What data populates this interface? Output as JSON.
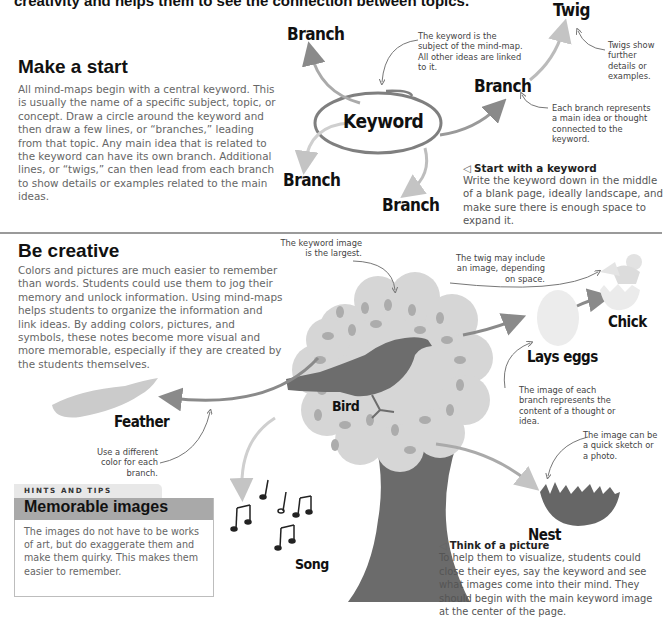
{
  "intro_line": "creativity and helps them to see the connection between topics.",
  "section1": {
    "heading": "Make a start",
    "body": "All mind-maps begin with a central keyword. This is usually the name of a specific subject, topic, or concept. Draw a circle around the keyword and then draw a few lines, or “branches,” leading from that topic. Any main idea that is related to the keyword can have its own branch. Additional lines, or “twigs,” can then lead from each branch to show details or examples related to the main ideas.",
    "diagram": {
      "keyword": "Keyword",
      "branch_top_left": "Branch",
      "branch_right": "Branch",
      "branch_bottom_left": "Branch",
      "branch_bottom": "Branch",
      "twig": "Twig",
      "note_keyword": "The keyword is the subject of the mind-map. All other ideas are linked to it.",
      "note_twigs": "Twigs show further details or examples.",
      "note_branch": "Each branch represents a main idea or thought connected to the keyword."
    },
    "caption": {
      "icon": "◁",
      "title": "Start with a keyword",
      "body": "Write the keyword down in the middle of a blank page, ideally landscape, and make sure there is enough space to expand it."
    }
  },
  "section2": {
    "heading": "Be creative",
    "body": "Colors and pictures are much easier to remember than words. Students could use them to jog their memory and unlock information. Using mind-maps helps students to organize the information and link ideas. By adding colors, pictures, and symbols, these notes become more visual and more memorable, especially if they are created by the students themselves.",
    "diagram": {
      "keyword": "Bird",
      "feather": "Feather",
      "song": "Song",
      "lays_eggs": "Lays eggs",
      "chick": "Chick",
      "nest": "Nest",
      "note_keyword_image": "The keyword image is the largest.",
      "note_twig_image": "The twig may include an image, depending on space.",
      "note_branch_image": "The image of each branch represents the content of a thought or idea.",
      "note_sketch": "The image can be a quick sketch or a photo.",
      "note_color": "Use a different color for each branch."
    },
    "hints": {
      "tab": "HINTS AND TIPS",
      "title": "Memorable images",
      "body": "The images do not have to be works of art, but do exaggerate them and make them quirky. This makes them easier to remember."
    },
    "caption": {
      "icon": "◁",
      "title": "Think of a picture",
      "body": "To help them to visualize, students could close their eyes, say the keyword and see what images come into their mind. They should begin with the main keyword image at the center of the page."
    }
  },
  "colors": {
    "text_dark": "#111111",
    "text_body": "#666666",
    "divider": "#9a9a9a",
    "arrow_dark": "#7a7a7a",
    "arrow_light": "#bdbdbd",
    "tree_trunk": "#6b6b6b",
    "canopy": "#d6d6d6",
    "leaf": "#a9a9a9",
    "hint_bar": "#a9a9a9"
  }
}
